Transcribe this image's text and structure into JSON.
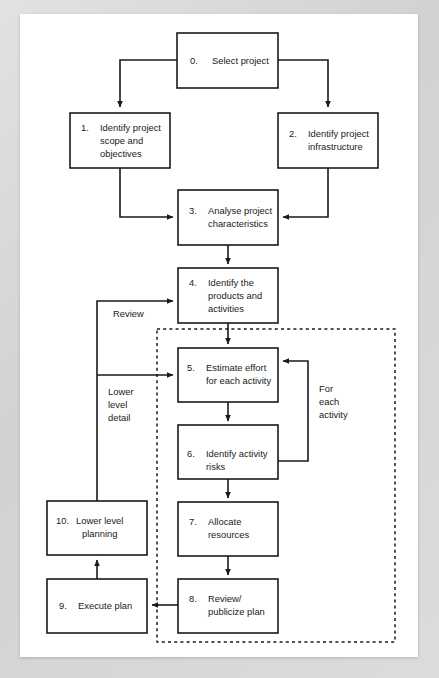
{
  "diagram": {
    "colors": {
      "page_background": "#ffffff",
      "frame_background": "#d8d8d8",
      "stroke": "#1a1a1a"
    },
    "nodes": [
      {
        "id": "n0",
        "number": "0.",
        "lines": [
          "Select project"
        ],
        "x": 177,
        "y": 33,
        "w": 101,
        "h": 55
      },
      {
        "id": "n1",
        "number": "1.",
        "lines": [
          "Identify project",
          "scope and",
          "objectives"
        ],
        "x": 70,
        "y": 113,
        "w": 100,
        "h": 55
      },
      {
        "id": "n2",
        "number": "2.",
        "lines": [
          "Identify project",
          "infrastructure"
        ],
        "x": 278,
        "y": 113,
        "w": 100,
        "h": 55
      },
      {
        "id": "n3",
        "number": "3.",
        "lines": [
          "Analyse project",
          "characteristics"
        ],
        "x": 178,
        "y": 190,
        "w": 100,
        "h": 55
      },
      {
        "id": "n4",
        "number": "4.",
        "lines": [
          "Identify the",
          "products and",
          "activities"
        ],
        "x": 178,
        "y": 268,
        "w": 100,
        "h": 55
      },
      {
        "id": "n5",
        "number": "5.",
        "lines": [
          "Estimate effort",
          "for each activity"
        ],
        "x": 178,
        "y": 348,
        "w": 100,
        "h": 54
      },
      {
        "id": "n6",
        "number": "6.",
        "lines": [
          "Identify activity",
          "risks"
        ],
        "x": 178,
        "y": 425,
        "w": 100,
        "h": 54
      },
      {
        "id": "n7",
        "number": "7.",
        "lines": [
          "Allocate",
          "resources"
        ],
        "x": 178,
        "y": 502,
        "w": 100,
        "h": 54
      },
      {
        "id": "n8",
        "number": "8.",
        "lines": [
          "Review/",
          "publicize plan"
        ],
        "x": 178,
        "y": 579,
        "w": 100,
        "h": 54
      },
      {
        "id": "n9",
        "number": "9.",
        "lines": [
          "Execute plan"
        ],
        "x": 47,
        "y": 579,
        "w": 100,
        "h": 54
      },
      {
        "id": "n10",
        "number": "10.",
        "lines": [
          "Lower level",
          "planning"
        ],
        "x": 47,
        "y": 501,
        "w": 100,
        "h": 54
      }
    ],
    "group_box": {
      "label": "for-each-activity-dashed-region",
      "x": 157,
      "y": 329,
      "w": 238,
      "h": 313
    },
    "annotations": [
      {
        "id": "a-review",
        "lines": [
          "Review"
        ],
        "x": 113,
        "y": 313
      },
      {
        "id": "a-lower-level",
        "lines": [
          "Lower",
          "level",
          "detail"
        ],
        "x": 108,
        "y": 391
      },
      {
        "id": "a-for-each",
        "lines": [
          "For",
          "each",
          "activity"
        ],
        "x": 319,
        "y": 388
      }
    ],
    "connectors": [
      {
        "id": "c0-1",
        "from": "n0",
        "to": "n1",
        "desc": "select-project-to-identify-scope"
      },
      {
        "id": "c0-2",
        "from": "n0",
        "to": "n2",
        "desc": "select-project-to-identify-infrastructure"
      },
      {
        "id": "c1-3",
        "from": "n1",
        "to": "n3",
        "desc": "identify-scope-to-analyse"
      },
      {
        "id": "c2-3",
        "from": "n2",
        "to": "n3",
        "desc": "identify-infrastructure-to-analyse"
      },
      {
        "id": "c3-4",
        "from": "n3",
        "to": "n4",
        "desc": "analyse-to-identify-products"
      },
      {
        "id": "c4-5",
        "from": "n4",
        "to": "n5",
        "desc": "identify-products-to-estimate-effort"
      },
      {
        "id": "c5-6",
        "from": "n5",
        "to": "n6",
        "desc": "estimate-effort-to-identify-risks"
      },
      {
        "id": "c6-5",
        "from": "n6",
        "to": "n5",
        "desc": "identify-risks-back-to-estimate-effort"
      },
      {
        "id": "c6-7",
        "from": "n6",
        "to": "n7",
        "desc": "identify-risks-to-allocate-resources"
      },
      {
        "id": "c7-8",
        "from": "n7",
        "to": "n8",
        "desc": "allocate-resources-to-review-publicize"
      },
      {
        "id": "c8-9",
        "from": "n8",
        "to": "n9",
        "desc": "review-publicize-to-execute-plan"
      },
      {
        "id": "c9-10",
        "from": "n9",
        "to": "n10",
        "desc": "execute-plan-to-lower-level-planning"
      },
      {
        "id": "c10-4",
        "from": "n10",
        "to": "n4",
        "desc": "lower-level-planning-review-to-identify-products"
      },
      {
        "id": "c10-5",
        "from": "n10",
        "to": "n5",
        "desc": "lower-level-detail-to-estimate-effort"
      }
    ]
  }
}
